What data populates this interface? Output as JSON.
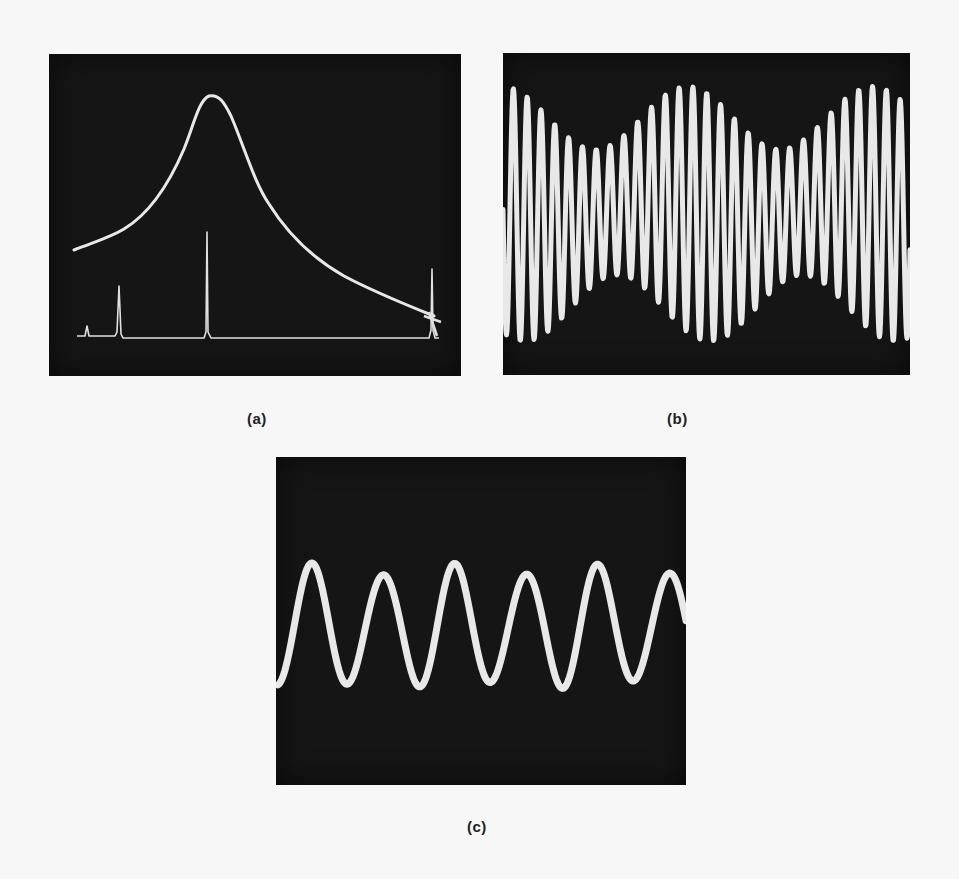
{
  "figure": {
    "panels": [
      {
        "id": "a",
        "label": "(a)",
        "description": "Oscilloscope trace: broad resonance peak curve with a lower baseline trace showing sharp narrow spikes"
      },
      {
        "id": "b",
        "label": "(b)",
        "description": "Oscilloscope trace: high-frequency oscillation with slowly varying amplitude envelope (beats)"
      },
      {
        "id": "c",
        "label": "(c)",
        "description": "Oscilloscope trace: nearly sinusoidal waveform, about six cycles"
      }
    ],
    "colors": {
      "paper": "#f7f7f7",
      "screen": "#151515",
      "trace": "#e8e8e8",
      "label": "#222222"
    }
  }
}
